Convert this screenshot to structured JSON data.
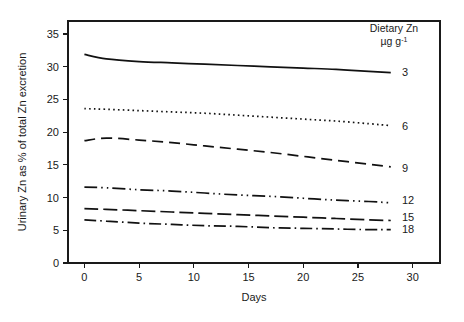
{
  "chart_data": {
    "type": "line",
    "title": "",
    "xlabel": "Days",
    "ylabel": "Urinary Zn as % of total Zn excretion",
    "xlim": [
      -1.5,
      32.5
    ],
    "ylim": [
      0,
      37
    ],
    "xticks": [
      0,
      5,
      10,
      15,
      20,
      25,
      30
    ],
    "xtick_labels": [
      "0",
      "5",
      "10",
      "15",
      "20",
      "25",
      "30"
    ],
    "yticks": [
      0,
      5,
      10,
      15,
      20,
      25,
      30,
      35
    ],
    "ytick_labels": [
      "0",
      "5",
      "10",
      "15",
      "20",
      "25",
      "30",
      "35"
    ],
    "grid": false,
    "legend_position": "right-inside",
    "legend_title_line1": "Dietary Zn",
    "legend_title_line2": "µg g",
    "legend_title_exponent": "-1",
    "x": [
      0,
      2,
      5,
      8,
      11,
      14,
      17,
      20,
      23,
      26,
      28
    ],
    "series": [
      {
        "name": "3",
        "label": "3",
        "dash": "none",
        "dasharray": "0",
        "values": [
          31.9,
          31.2,
          30.8,
          30.6,
          30.4,
          30.2,
          30.0,
          29.8,
          29.6,
          29.3,
          29.1
        ]
      },
      {
        "name": "6",
        "label": "6",
        "dash": "dotted",
        "dasharray": "1.6 3.2",
        "values": [
          23.6,
          23.5,
          23.3,
          23.1,
          22.9,
          22.6,
          22.3,
          22.0,
          21.7,
          21.3,
          21.0
        ]
      },
      {
        "name": "9",
        "label": "9",
        "dash": "dashed-long",
        "dasharray": "11 6",
        "values": [
          18.7,
          19.1,
          18.8,
          18.4,
          17.9,
          17.4,
          16.9,
          16.3,
          15.7,
          15.1,
          14.7
        ]
      },
      {
        "name": "12",
        "label": "12",
        "dash": "dash-dot-dot",
        "dasharray": "13 4 1.5 4 1.5 4",
        "values": [
          11.6,
          11.5,
          11.2,
          11.0,
          10.7,
          10.4,
          10.2,
          9.9,
          9.6,
          9.4,
          9.2
        ]
      },
      {
        "name": "15",
        "label": "15",
        "dash": "dashed-medium",
        "dasharray": "14 5",
        "values": [
          8.3,
          8.2,
          8.0,
          7.8,
          7.6,
          7.4,
          7.2,
          7.0,
          6.8,
          6.6,
          6.5
        ]
      },
      {
        "name": "18",
        "label": "18",
        "dash": "dash-dot",
        "dasharray": "12 4 1.6 4",
        "values": [
          6.6,
          6.4,
          6.1,
          5.9,
          5.7,
          5.6,
          5.4,
          5.3,
          5.2,
          5.1,
          5.1
        ]
      }
    ],
    "series_label_positions": [
      29.2,
      21.0,
      14.6,
      9.6,
      7.0,
      5.2
    ]
  },
  "colors": {
    "ink": "#1a1a1a",
    "line": "#111111",
    "background": "#ffffff"
  },
  "plot_box": {
    "left": 68,
    "top": 21,
    "right": 440,
    "bottom": 263
  }
}
